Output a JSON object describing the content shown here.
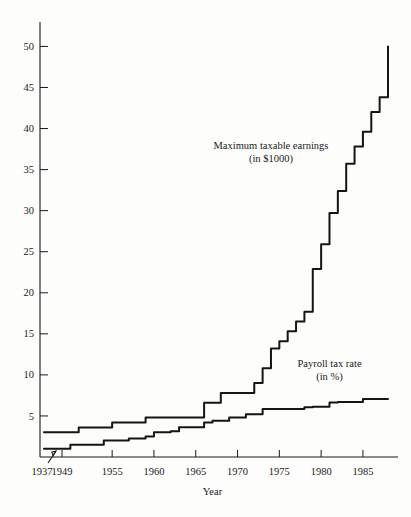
{
  "chart_data": {
    "type": "line",
    "title": "",
    "subtitle": "",
    "xlabel": "Year",
    "ylabel": "",
    "grid": false,
    "legend_position": "inline-annotation",
    "xlim": [
      1937,
      1988
    ],
    "ylim": [
      0,
      52
    ],
    "x_ticks": [
      1937,
      1949,
      1955,
      1960,
      1965,
      1970,
      1975,
      1980,
      1985
    ],
    "x_tick_labels": [
      "1937",
      "1949",
      "1955",
      "1960",
      "1965",
      "1970",
      "1975",
      "1980",
      "1985"
    ],
    "y_ticks": [
      5,
      10,
      15,
      20,
      25,
      30,
      35,
      40,
      45,
      50
    ],
    "y_tick_labels": [
      "5",
      "10",
      "15",
      "20",
      "25",
      "30",
      "35",
      "40",
      "45",
      "50"
    ],
    "axis_break": {
      "present": true,
      "between": [
        1937,
        1949
      ],
      "symbol": "slash-arrow"
    },
    "annotations": [
      {
        "name": "maximum-taxable-earnings-label",
        "line1": "Maximum taxable earnings",
        "line2": "(in $1000)",
        "x": 1974,
        "y": 37.5
      },
      {
        "name": "payroll-tax-rate-label",
        "line1": "Payroll tax rate",
        "line2": "(in %)",
        "x": 1981,
        "y": 11.0
      }
    ],
    "series": [
      {
        "name": "Maximum taxable earnings",
        "units": "in $1000",
        "step": true,
        "x": [
          1937,
          1949,
          1950,
          1951,
          1954,
          1955,
          1958,
          1959,
          1962,
          1963,
          1965,
          1966,
          1967,
          1968,
          1971,
          1972,
          1973,
          1974,
          1975,
          1976,
          1977,
          1978,
          1979,
          1980,
          1981,
          1982,
          1983,
          1984,
          1985,
          1986,
          1987,
          1988
        ],
        "values": [
          3.0,
          3.0,
          3.0,
          3.6,
          3.6,
          4.2,
          4.2,
          4.8,
          4.8,
          4.8,
          4.8,
          6.6,
          6.6,
          7.8,
          7.8,
          9.0,
          10.8,
          13.2,
          14.1,
          15.3,
          16.5,
          17.7,
          22.9,
          25.9,
          29.7,
          32.4,
          35.7,
          37.8,
          39.6,
          42.0,
          43.8,
          50.0
        ],
        "color": "#151515"
      },
      {
        "name": "Payroll tax rate",
        "units": "in %",
        "step": true,
        "x": [
          1937,
          1949,
          1950,
          1951,
          1954,
          1955,
          1957,
          1959,
          1960,
          1962,
          1963,
          1966,
          1967,
          1968,
          1969,
          1971,
          1973,
          1978,
          1979,
          1981,
          1982,
          1984,
          1985,
          1988
        ],
        "values": [
          1.0,
          1.0,
          1.5,
          1.5,
          2.0,
          2.0,
          2.25,
          2.5,
          3.0,
          3.125,
          3.625,
          4.2,
          4.4,
          4.4,
          4.8,
          5.2,
          5.85,
          6.05,
          6.13,
          6.65,
          6.7,
          6.7,
          7.05,
          7.05
        ],
        "color": "#151515"
      }
    ]
  },
  "colors": {
    "background": "#fdfdfb",
    "ink": "#1a1a1a",
    "line": "#151515"
  }
}
